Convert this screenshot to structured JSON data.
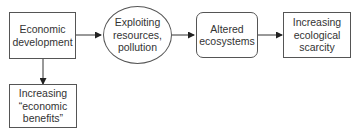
{
  "diagram": {
    "nodes": [
      {
        "id": "econ_dev",
        "label": "Economic\ndevelopment",
        "shape": "rectangle"
      },
      {
        "id": "exploiting",
        "label": "Exploiting\nresources,\npollution",
        "shape": "ellipse"
      },
      {
        "id": "altered",
        "label": "Altered\necosystems",
        "shape": "rounded-rectangle"
      },
      {
        "id": "scarcity",
        "label": "Increasing\necological\nscarcity",
        "shape": "rectangle"
      },
      {
        "id": "benefits",
        "label": "Increasing\n“economic\nbenefits”",
        "shape": "rectangle"
      }
    ],
    "edges": [
      {
        "from": "econ_dev",
        "to": "exploiting"
      },
      {
        "from": "exploiting",
        "to": "altered"
      },
      {
        "from": "altered",
        "to": "scarcity"
      },
      {
        "from": "econ_dev",
        "to": "benefits"
      }
    ]
  }
}
